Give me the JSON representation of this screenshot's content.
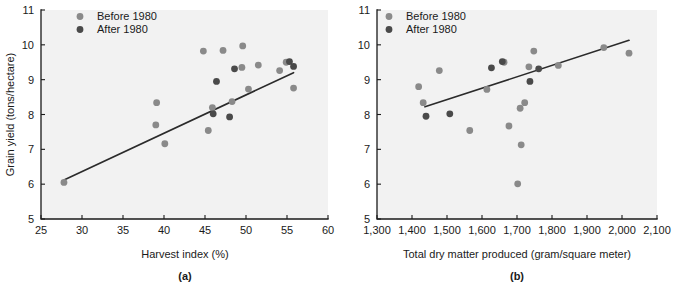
{
  "figure": {
    "series_colors": {
      "before_1980": "#8a8a8a",
      "after_1980": "#4a4a4a"
    },
    "line_color": "#2b2b2b",
    "legend": {
      "before_label": "Before 1980",
      "after_label": "After 1980"
    }
  },
  "chart_data": [
    {
      "type": "scatter",
      "panel": "(a)",
      "title": "",
      "xlabel": "Harvest index (%)",
      "ylabel": "Grain yield (tons/hectare)",
      "xlim": [
        25,
        60
      ],
      "ylim": [
        5,
        11
      ],
      "xticks": [
        25,
        30,
        35,
        40,
        45,
        50,
        55,
        60
      ],
      "xticklabels": [
        "25",
        "30",
        "35",
        "40",
        "45",
        "50",
        "55",
        "60"
      ],
      "yticks": [
        5,
        6,
        7,
        8,
        9,
        10,
        11
      ],
      "yticklabels": [
        "5",
        "6",
        "7",
        "8",
        "9",
        "10",
        "11"
      ],
      "grid": false,
      "legend_position": "upper left",
      "series": [
        {
          "name": "Before 1980",
          "marker": "circle",
          "color": "#8a8a8a",
          "points": [
            [
              27.8,
              6.05
            ],
            [
              39.1,
              8.34
            ],
            [
              39.0,
              7.7
            ],
            [
              40.1,
              7.16
            ],
            [
              44.8,
              9.82
            ],
            [
              45.4,
              7.54
            ],
            [
              45.9,
              8.2
            ],
            [
              47.2,
              9.84
            ],
            [
              48.3,
              8.37
            ],
            [
              49.6,
              9.97
            ],
            [
              49.5,
              9.35
            ],
            [
              50.3,
              8.73
            ],
            [
              51.5,
              9.42
            ],
            [
              54.1,
              9.26
            ],
            [
              54.9,
              9.5
            ],
            [
              55.8,
              8.76
            ]
          ]
        },
        {
          "name": "After 1980",
          "marker": "circle",
          "color": "#4a4a4a",
          "points": [
            [
              46.0,
              8.02
            ],
            [
              46.4,
              8.95
            ],
            [
              48.0,
              7.93
            ],
            [
              48.6,
              9.31
            ],
            [
              55.3,
              9.52
            ],
            [
              55.8,
              9.38
            ]
          ]
        }
      ],
      "fit_line": {
        "x_start": 27.8,
        "y_start": 6.12,
        "x_end": 55.8,
        "y_end": 9.2
      }
    },
    {
      "type": "scatter",
      "panel": "(b)",
      "title": "",
      "xlabel": "Total dry matter produced (gram/square meter)",
      "ylabel": "Grain yield (tons/hectare)",
      "xlim": [
        1300,
        2100
      ],
      "ylim": [
        5,
        11
      ],
      "xticks": [
        1300,
        1400,
        1500,
        1600,
        1700,
        1800,
        1900,
        2000,
        2100
      ],
      "xticklabels": [
        "1,300",
        "1,400",
        "1,500",
        "1,600",
        "1,700",
        "1,800",
        "1,900",
        "2,000",
        "2,100"
      ],
      "yticks": [
        5,
        6,
        7,
        8,
        9,
        10,
        11
      ],
      "yticklabels": [
        "5",
        "6",
        "7",
        "8",
        "9",
        "10",
        "11"
      ],
      "grid": false,
      "legend_position": "upper left",
      "series": [
        {
          "name": "Before 1980",
          "marker": "circle",
          "color": "#8a8a8a",
          "points": [
            [
              1419,
              8.8
            ],
            [
              1432,
              8.34
            ],
            [
              1478,
              9.26
            ],
            [
              1565,
              7.54
            ],
            [
              1614,
              8.72
            ],
            [
              1663,
              9.5
            ],
            [
              1677,
              7.67
            ],
            [
              1702,
              6.01
            ],
            [
              1709,
              8.18
            ],
            [
              1712,
              7.13
            ],
            [
              1722,
              8.34
            ],
            [
              1734,
              9.37
            ],
            [
              1748,
              9.82
            ],
            [
              1818,
              9.41
            ],
            [
              1948,
              9.92
            ],
            [
              2020,
              9.76
            ]
          ]
        },
        {
          "name": "After 1980",
          "marker": "circle",
          "color": "#4a4a4a",
          "points": [
            [
              1440,
              7.95
            ],
            [
              1508,
              8.02
            ],
            [
              1627,
              9.34
            ],
            [
              1658,
              9.52
            ],
            [
              1737,
              8.95
            ],
            [
              1762,
              9.31
            ]
          ]
        }
      ],
      "fit_line": {
        "x_start": 1437,
        "y_start": 8.22,
        "x_end": 2020,
        "y_end": 10.13
      }
    }
  ]
}
